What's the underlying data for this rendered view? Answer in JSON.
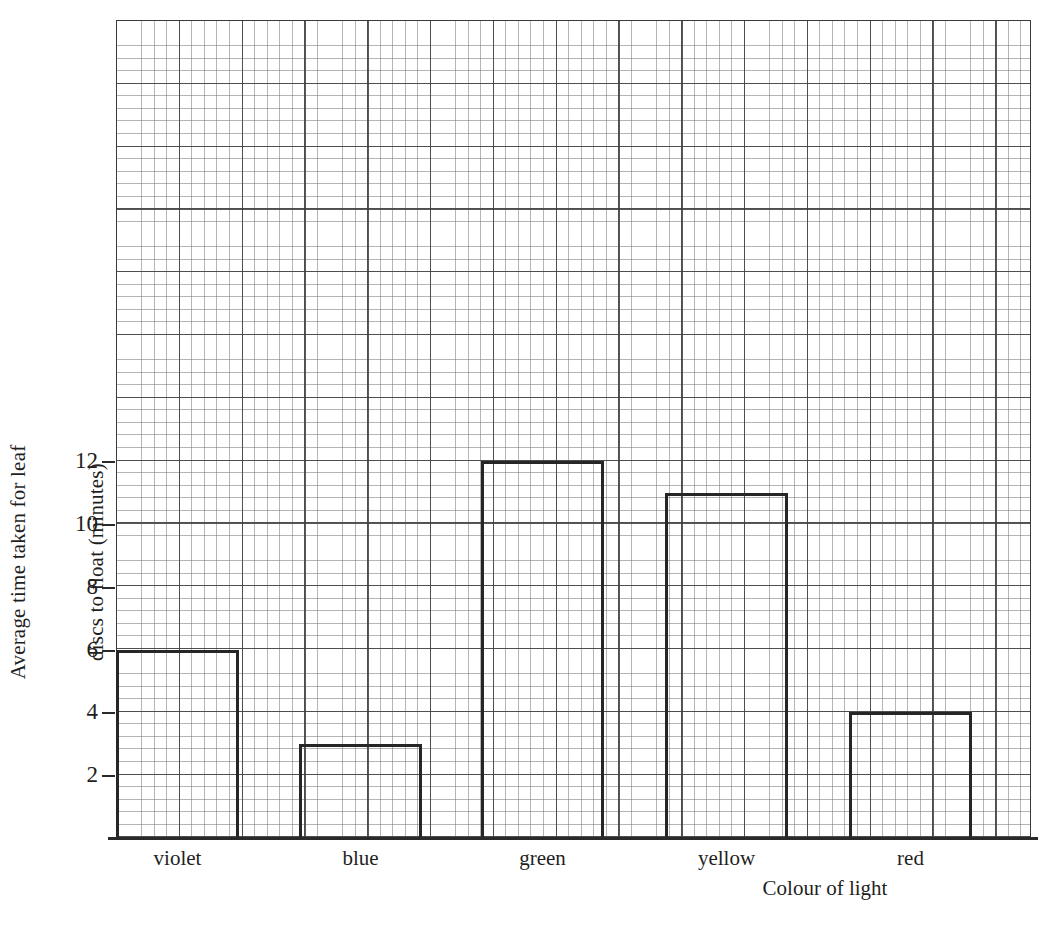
{
  "chart_data": {
    "type": "bar",
    "title": "",
    "subtitle": "",
    "xlabel": "Colour of light",
    "ylabel": "Average time taken for leaf discs to float (minutes)",
    "ylabel_lines": [
      "Average time taken for leaf",
      "discs to float (minutes)"
    ],
    "categories": [
      "violet",
      "blue",
      "green",
      "yellow",
      "red"
    ],
    "values": [
      6,
      3,
      12,
      11,
      4
    ],
    "ylim": [
      0,
      13
    ],
    "ytick_labels": [
      "12",
      "10",
      "8",
      "6",
      "4",
      "2"
    ],
    "ytick_values": [
      12,
      10,
      8,
      6,
      4,
      2
    ],
    "grid": "graph-paper",
    "grid_major_units": 1,
    "grid_minor_per_major": 5,
    "legend": "none",
    "bar_style": "outline",
    "bar_stroke_color": "#262626",
    "bar_fill_color": "transparent",
    "grid_major_color": "#3c3c3c",
    "grid_minor_color": "#787878",
    "axis_color": "#2a2a2a",
    "background_color": "#ffffff"
  },
  "axes": {
    "y_ticks": [
      {
        "label": "12",
        "value": 12
      },
      {
        "label": "10",
        "value": 10
      },
      {
        "label": "8",
        "value": 8
      },
      {
        "label": "6",
        "value": 6
      },
      {
        "label": "4",
        "value": 4
      },
      {
        "label": "2",
        "value": 2
      }
    ],
    "x_categories": [
      {
        "label": "violet",
        "value": 6
      },
      {
        "label": "blue",
        "value": 3
      },
      {
        "label": "green",
        "value": 12
      },
      {
        "label": "yellow",
        "value": 11
      },
      {
        "label": "red",
        "value": 4
      }
    ],
    "y_title_line_1": "Average time taken for leaf",
    "y_title_line_2": "discs to float (minutes)",
    "x_title": "Colour of light"
  }
}
